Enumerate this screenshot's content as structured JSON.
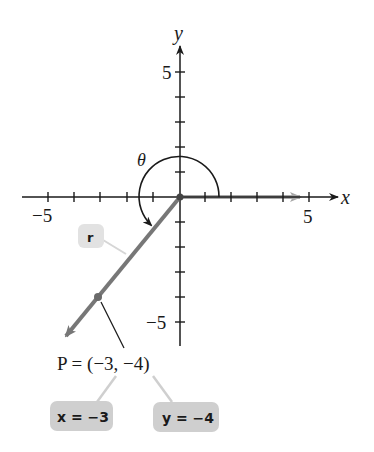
{
  "axes": {
    "x_label": "x",
    "y_label": "y",
    "x_tick_labels": {
      "neg": "−5",
      "pos": "5"
    },
    "y_tick_labels": {
      "pos": "5",
      "neg": "−5"
    },
    "range": [
      -5,
      5
    ]
  },
  "angle": {
    "label": "θ"
  },
  "ray": {
    "label": "r"
  },
  "point": {
    "label": "P = (−3, −4)",
    "x": -3,
    "y": -4
  },
  "callouts": {
    "x_value": "x = −3",
    "y_value": "y = −4"
  },
  "colors": {
    "axis": "#1a1a1a",
    "ray": "#777777",
    "initial_side": "#a8a8a8",
    "callout_box": "#cfcfcf",
    "leader": "#c8c8c8"
  }
}
